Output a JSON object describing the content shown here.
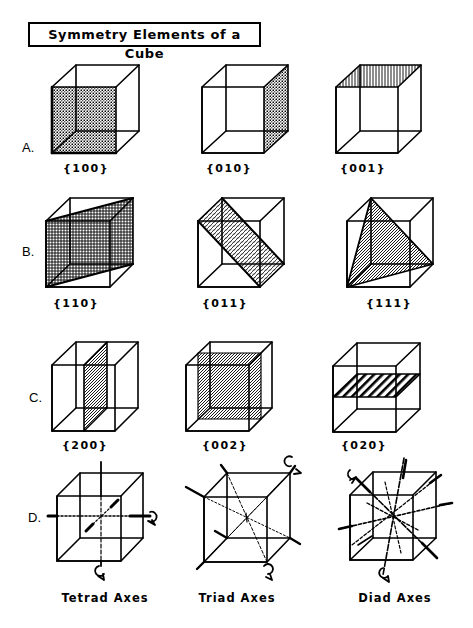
{
  "title": "Symmetry Elements of a Cube",
  "rows": [
    {
      "label": "A.",
      "label_pos": [
        22,
        140
      ],
      "items": [
        {
          "index": "{100}",
          "label_pos": [
            86,
            162
          ]
        },
        {
          "index": "{010}",
          "label_pos": [
            229,
            162
          ]
        },
        {
          "index": "{001}",
          "label_pos": [
            363,
            162
          ]
        }
      ]
    },
    {
      "label": "B.",
      "label_pos": [
        22,
        244
      ],
      "items": [
        {
          "index": "{110}",
          "label_pos": [
            76,
            297
          ]
        },
        {
          "index": "{011}",
          "label_pos": [
            225,
            297
          ]
        },
        {
          "index": "{111}",
          "label_pos": [
            389,
            297
          ]
        }
      ]
    },
    {
      "label": "C.",
      "label_pos": [
        29,
        390
      ],
      "items": [
        {
          "index": "{200}",
          "label_pos": [
            85,
            439
          ]
        },
        {
          "index": "{002}",
          "label_pos": [
            225,
            439
          ]
        },
        {
          "index": "{020}",
          "label_pos": [
            364,
            439
          ]
        }
      ]
    },
    {
      "label": "D.",
      "label_pos": [
        28,
        510
      ],
      "items": [
        {
          "index": "Tetrad Axes",
          "label_pos": [
            105,
            591
          ]
        },
        {
          "index": "Triad Axes",
          "label_pos": [
            237,
            591
          ]
        },
        {
          "index": "Diad Axes",
          "label_pos": [
            395,
            591
          ]
        }
      ]
    }
  ],
  "colors": {
    "ink": "#000000",
    "background": "#ffffff"
  }
}
